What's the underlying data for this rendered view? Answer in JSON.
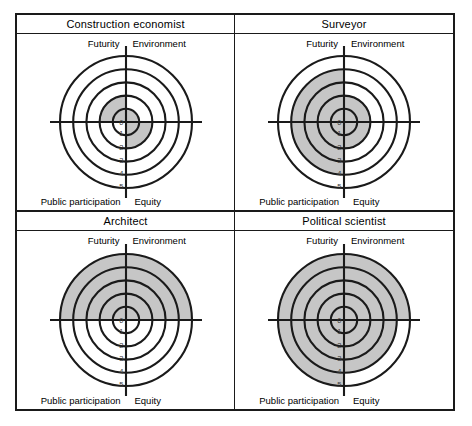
{
  "figure": {
    "layout": "2x2 grid of polar target charts",
    "axis_labels": {
      "top_left": "Futurity",
      "top_right": "Environment",
      "bottom_left": "Public participation",
      "bottom_right": "Equity"
    },
    "scale_ticks": [
      "0",
      "1",
      "2",
      "3",
      "4",
      "5"
    ],
    "colors": {
      "line": "#1a1a1a",
      "shade": "#c6c6c6",
      "background": "#ffffff",
      "tick_text": "#3d3d3d"
    }
  },
  "chart_data": [
    {
      "type": "radar",
      "title": "Construction economist",
      "categories": [
        "Futurity",
        "Environment",
        "Equity",
        "Public participation"
      ],
      "values": [
        2,
        1,
        2,
        0
      ],
      "rlim": [
        0,
        5
      ],
      "rticks": [
        0,
        1,
        2,
        3,
        4,
        5
      ],
      "grid": true,
      "legend": "none"
    },
    {
      "type": "radar",
      "title": "Surveyor",
      "categories": [
        "Futurity",
        "Environment",
        "Equity",
        "Public participation"
      ],
      "values": [
        4,
        2,
        2,
        4
      ],
      "rlim": [
        0,
        5
      ],
      "rticks": [
        0,
        1,
        2,
        3,
        4,
        5
      ],
      "grid": true,
      "legend": "none"
    },
    {
      "type": "radar",
      "title": "Architect",
      "categories": [
        "Futurity",
        "Environment",
        "Equity",
        "Public participation"
      ],
      "values": [
        5,
        5,
        0,
        0
      ],
      "rlim": [
        0,
        5
      ],
      "rticks": [
        0,
        1,
        2,
        3,
        4,
        5
      ],
      "grid": true,
      "legend": "none"
    },
    {
      "type": "radar",
      "title": "Political scientist",
      "categories": [
        "Futurity",
        "Environment",
        "Equity",
        "Public participation"
      ],
      "values": [
        5,
        5,
        4,
        5
      ],
      "rlim": [
        0,
        5
      ],
      "rticks": [
        0,
        1,
        2,
        3,
        4,
        5
      ],
      "grid": true,
      "legend": "none"
    }
  ]
}
